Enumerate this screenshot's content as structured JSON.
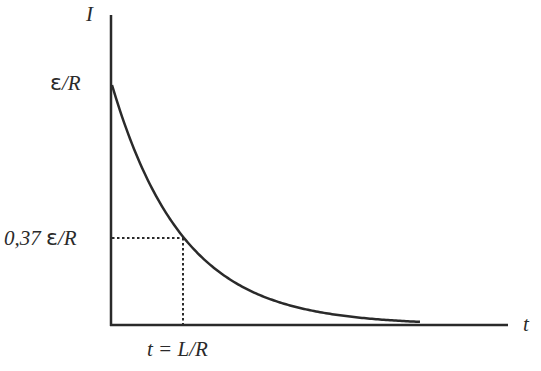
{
  "chart_data": {
    "type": "line",
    "title": "",
    "xlabel": "t",
    "ylabel": "I",
    "grid": false,
    "legend": null,
    "ytick_labels": [
      "ε/R",
      "0,37 ε/R"
    ],
    "xtick_labels": [
      "t = L/R"
    ],
    "series": [
      {
        "name": "I(t) = (ε/R)·e^(−tR/L)",
        "x_in_time_constants": [
          0,
          0.5,
          1,
          1.5,
          2,
          2.5,
          3,
          4,
          5,
          6
        ],
        "y_fraction_of_eps_over_R": [
          1.0,
          0.61,
          0.37,
          0.22,
          0.14,
          0.08,
          0.05,
          0.02,
          0.01,
          0.0
        ]
      }
    ],
    "annotations": [
      {
        "type": "dotted-guide",
        "x": "L/R",
        "y": "0,37 ε/R"
      }
    ],
    "ylim": [
      0,
      1.3
    ],
    "xlim": [
      0,
      5.5
    ]
  },
  "labels": {
    "y_axis": "I",
    "x_axis": "t",
    "y_max_eps": "ε",
    "y_max_rest": "/R",
    "y_mid_num": "0,37 ",
    "y_mid_eps": "ε",
    "y_mid_rest": "/R",
    "x_tick": "t = L/R"
  },
  "colors": {
    "line": "#2a2a2a",
    "background": "#ffffff"
  }
}
